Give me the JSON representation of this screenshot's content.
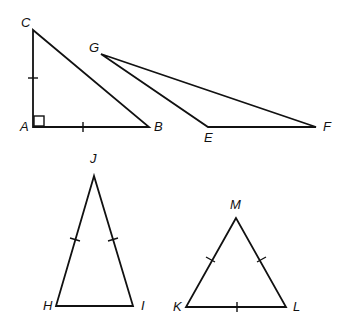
{
  "diagram": {
    "title": "",
    "triangles": [
      {
        "name": "ABC",
        "type": "right isosceles",
        "vertices": {
          "A": [
            33,
            127
          ],
          "B": [
            149,
            127
          ],
          "C": [
            33,
            30
          ]
        },
        "right_angle_at": "A",
        "congruent_marks": [
          "AC",
          "AB"
        ]
      },
      {
        "name": "EFG",
        "type": "obtuse scalene",
        "vertices": {
          "G": [
            101,
            54
          ],
          "E": [
            208,
            127
          ],
          "F": [
            316,
            127
          ]
        },
        "congruent_marks": []
      },
      {
        "name": "HIJ",
        "type": "isosceles",
        "vertices": {
          "J": [
            94,
            176
          ],
          "H": [
            56,
            306
          ],
          "I": [
            133,
            306
          ]
        },
        "congruent_marks": [
          "JH",
          "JI"
        ]
      },
      {
        "name": "KLM",
        "type": "equilateral",
        "vertices": {
          "M": [
            236,
            218
          ],
          "K": [
            186,
            307
          ],
          "L": [
            286,
            307
          ]
        },
        "congruent_marks": [
          "MK",
          "ML",
          "KL"
        ]
      }
    ],
    "labels": {
      "A": "A",
      "B": "B",
      "C": "C",
      "E": "E",
      "F": "F",
      "G": "G",
      "H": "H",
      "I": "I",
      "J": "J",
      "K": "K",
      "L": "L",
      "M": "M"
    },
    "colors": {
      "stroke": "#111111",
      "background": "#ffffff"
    }
  }
}
